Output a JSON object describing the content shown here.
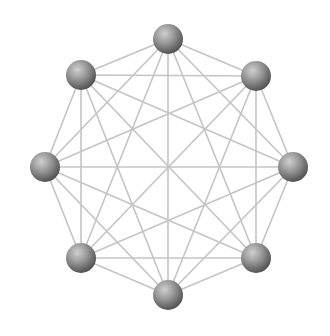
{
  "diagram": {
    "type": "complete-graph",
    "edge_color": "#c4c4c4",
    "node_color_light": "#b8b8b8",
    "node_color_dark": "#5e5e5e",
    "node_radius": 15,
    "nodes": [
      {
        "id": "n0",
        "x": 168,
        "y": 39
      },
      {
        "id": "n1",
        "x": 256,
        "y": 76
      },
      {
        "id": "n2",
        "x": 293,
        "y": 167
      },
      {
        "id": "n3",
        "x": 256,
        "y": 258
      },
      {
        "id": "n4",
        "x": 168,
        "y": 295
      },
      {
        "id": "n5",
        "x": 81,
        "y": 258
      },
      {
        "id": "n6",
        "x": 45,
        "y": 167
      },
      {
        "id": "n7",
        "x": 81,
        "y": 75
      }
    ]
  }
}
